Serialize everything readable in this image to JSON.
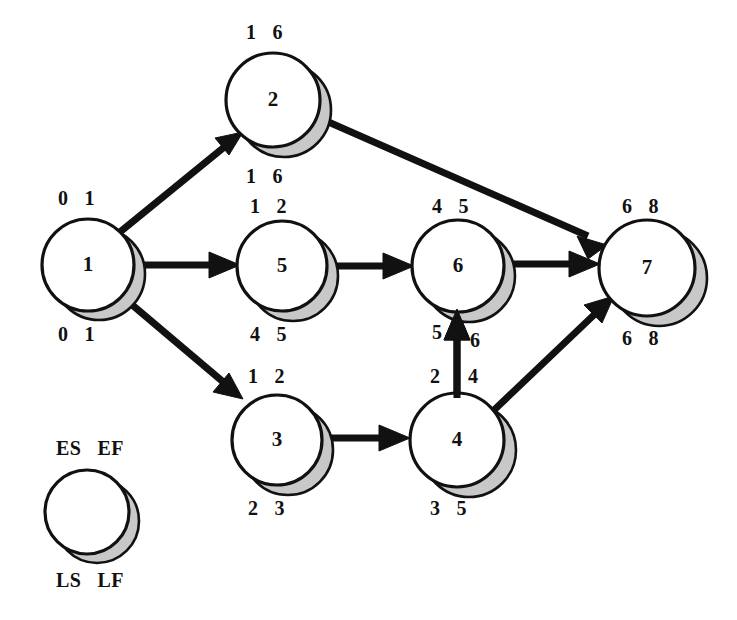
{
  "diagram": {
    "type": "pert-cpm-network",
    "title": "",
    "legend": {
      "top_left": "ES",
      "top_right": "EF",
      "bottom_left": "LS",
      "bottom_right": "LF",
      "circle_label": ""
    },
    "colors": {
      "node_fill": "#ffffff",
      "node_stroke": "#111111",
      "shadow_fill": "#c8c8c8",
      "edge": "#111111",
      "text": "#111111",
      "background": "#ffffff"
    },
    "nodes": [
      {
        "id": "1",
        "label": "1",
        "cx": 88,
        "cy": 265,
        "r": 46,
        "es": "0",
        "ef": "1",
        "ls": "0",
        "lf": "1"
      },
      {
        "id": "2",
        "label": "2",
        "cx": 273,
        "cy": 100,
        "r": 47,
        "es": "1",
        "ef": "6",
        "ls": "1",
        "lf": "6"
      },
      {
        "id": "3",
        "label": "3",
        "cx": 277,
        "cy": 440,
        "r": 45,
        "es": "1",
        "ef": "2",
        "ls": "2",
        "lf": "3"
      },
      {
        "id": "4",
        "label": "4",
        "cx": 457,
        "cy": 440,
        "r": 47,
        "es": "2",
        "ef": "4",
        "ls": "3",
        "lf": "5"
      },
      {
        "id": "5",
        "label": "5",
        "cx": 282,
        "cy": 266,
        "r": 45,
        "es": "1",
        "ef": "2",
        "ls": "4",
        "lf": "5"
      },
      {
        "id": "6",
        "label": "6",
        "cx": 458,
        "cy": 266,
        "r": 46,
        "es": "4",
        "ef": "5",
        "ls": "5",
        "lf": "6"
      },
      {
        "id": "7",
        "label": "7",
        "cx": 647,
        "cy": 268,
        "r": 48,
        "es": "6",
        "ef": "8",
        "ls": "6",
        "lf": "8"
      }
    ],
    "edges": [
      {
        "from": "1",
        "to": "2"
      },
      {
        "from": "1",
        "to": "5"
      },
      {
        "from": "1",
        "to": "3"
      },
      {
        "from": "2",
        "to": "7"
      },
      {
        "from": "5",
        "to": "6"
      },
      {
        "from": "6",
        "to": "7"
      },
      {
        "from": "3",
        "to": "4"
      },
      {
        "from": "4",
        "to": "6"
      },
      {
        "from": "4",
        "to": "7"
      }
    ]
  }
}
